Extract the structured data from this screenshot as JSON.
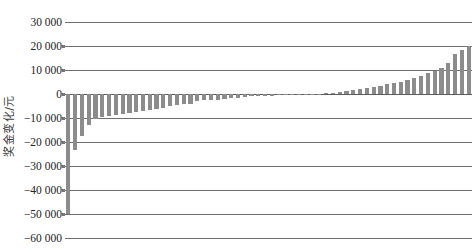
{
  "chart_data": {
    "type": "bar",
    "title": "",
    "subtitle": "",
    "xlabel": "",
    "ylabel": "奖金变化/元",
    "ylim": [
      -60000,
      30000
    ],
    "ytick_labels": [
      "30 000",
      "20 000",
      "10 000",
      "0",
      "−10 000",
      "−20 000",
      "−30 000",
      "−40 000",
      "−50 000",
      "−60 000"
    ],
    "ytick_values": [
      30000,
      20000,
      10000,
      0,
      -10000,
      -20000,
      -30000,
      -40000,
      -50000,
      -60000
    ],
    "ytick_step": 10000,
    "grid": true,
    "grid_orientation": "horizontal",
    "legend": "none",
    "xtick_labels": [],
    "bar_color": "#8c8c8c",
    "gridline_color": "#6f6f6f",
    "background_color": "#ffffff",
    "n_bars": 60,
    "categories": [
      "1",
      "2",
      "3",
      "4",
      "5",
      "6",
      "7",
      "8",
      "9",
      "10",
      "11",
      "12",
      "13",
      "14",
      "15",
      "16",
      "17",
      "18",
      "19",
      "20",
      "21",
      "22",
      "23",
      "24",
      "25",
      "26",
      "27",
      "28",
      "29",
      "30",
      "31",
      "32",
      "33",
      "34",
      "35",
      "36",
      "37",
      "38",
      "39",
      "40",
      "41",
      "42",
      "43",
      "44",
      "45",
      "46",
      "47",
      "48",
      "49",
      "50",
      "51",
      "52",
      "53",
      "54",
      "55",
      "56",
      "57",
      "58",
      "59",
      "60"
    ],
    "values": [
      -50000,
      -23500,
      -17500,
      -13000,
      -10500,
      -9500,
      -9000,
      -8600,
      -8200,
      -7800,
      -7400,
      -7000,
      -6600,
      -6300,
      -6000,
      -5000,
      -4600,
      -4300,
      -4000,
      -3000,
      -2700,
      -2500,
      -2300,
      -2000,
      -1700,
      -1500,
      -1200,
      -1000,
      -900,
      -800,
      -700,
      -600,
      -500,
      -400,
      -300,
      -200,
      -100,
      200,
      400,
      600,
      900,
      1200,
      1600,
      2000,
      2400,
      2900,
      3400,
      4000,
      4600,
      5200,
      6000,
      6800,
      7600,
      8600,
      9600,
      11000,
      13000,
      16500,
      18500,
      20000
    ]
  },
  "axis": {
    "y_title": "奖金变化/元"
  }
}
